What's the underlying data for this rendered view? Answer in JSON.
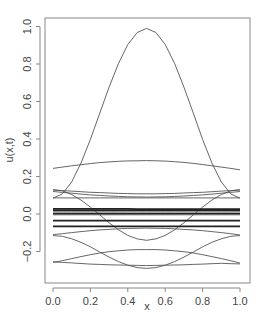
{
  "chart_data": {
    "type": "line",
    "title": "",
    "xlabel": "x",
    "ylabel": "u(x,t)",
    "xlim": [
      -0.04,
      1.04
    ],
    "ylim": [
      -0.37,
      1.04
    ],
    "grid": false,
    "legend": "none",
    "x_ticks": [
      0.0,
      0.2,
      0.4,
      0.6,
      0.8,
      1.0
    ],
    "x_tick_labels": [
      "0.0",
      "0.2",
      "0.4",
      "0.6",
      "0.8",
      "1.0"
    ],
    "y_ticks": [
      -0.2,
      0.0,
      0.2,
      0.4,
      0.6,
      0.8,
      1.0
    ],
    "y_tick_labels": [
      "−0.2",
      "0.0",
      "0.2",
      "0.4",
      "0.6",
      "0.8",
      "1.0"
    ],
    "x": [
      0,
      0.05,
      0.1,
      0.15,
      0.2,
      0.25,
      0.3,
      0.35,
      0.4,
      0.45,
      0.5,
      0.55,
      0.6,
      0.65,
      0.7,
      0.75,
      0.8,
      0.85,
      0.9,
      0.95,
      1.0
    ],
    "series": [
      {
        "name": "t0",
        "bold": false,
        "values": [
          0.085,
          0.107,
          0.171,
          0.272,
          0.398,
          0.538,
          0.677,
          0.803,
          0.904,
          0.968,
          0.99,
          0.968,
          0.904,
          0.803,
          0.677,
          0.538,
          0.398,
          0.272,
          0.171,
          0.107,
          0.085
        ]
      },
      {
        "name": "t1",
        "bold": false,
        "values": [
          0.13,
          0.123,
          0.104,
          0.074,
          0.037,
          -0.005,
          -0.047,
          -0.084,
          -0.114,
          -0.133,
          -0.14,
          -0.133,
          -0.114,
          -0.084,
          -0.047,
          -0.005,
          0.037,
          0.074,
          0.104,
          0.123,
          0.13
        ]
      },
      {
        "name": "t2",
        "bold": false,
        "values": [
          -0.115,
          -0.119,
          -0.132,
          -0.151,
          -0.175,
          -0.203,
          -0.23,
          -0.254,
          -0.273,
          -0.286,
          -0.29,
          -0.286,
          -0.273,
          -0.254,
          -0.23,
          -0.203,
          -0.175,
          -0.151,
          -0.132,
          -0.119,
          -0.115
        ]
      },
      {
        "name": "t3",
        "bold": false,
        "values": [
          0.243,
          0.25,
          0.257,
          0.263,
          0.269,
          0.274,
          0.278,
          0.281,
          0.283,
          0.284,
          0.285,
          0.284,
          0.282,
          0.279,
          0.275,
          0.27,
          0.264,
          0.257,
          0.25,
          0.243,
          0.236
        ]
      },
      {
        "name": "t4",
        "bold": false,
        "values": [
          -0.258,
          -0.249,
          -0.238,
          -0.227,
          -0.217,
          -0.208,
          -0.201,
          -0.196,
          -0.192,
          -0.19,
          -0.19,
          -0.19,
          -0.192,
          -0.196,
          -0.201,
          -0.208,
          -0.217,
          -0.227,
          -0.238,
          -0.249,
          -0.262
        ]
      },
      {
        "name": "t5",
        "bold": false,
        "values": [
          -0.11,
          -0.105,
          -0.099,
          -0.094,
          -0.089,
          -0.085,
          -0.082,
          -0.079,
          -0.077,
          -0.076,
          -0.075,
          -0.076,
          -0.077,
          -0.079,
          -0.082,
          -0.085,
          -0.089,
          -0.094,
          -0.099,
          -0.105,
          -0.112
        ]
      },
      {
        "name": "t6",
        "bold": false,
        "values": [
          -0.255,
          -0.258,
          -0.261,
          -0.264,
          -0.267,
          -0.269,
          -0.271,
          -0.272,
          -0.273,
          -0.274,
          -0.275,
          -0.274,
          -0.273,
          -0.272,
          -0.271,
          -0.269,
          -0.267,
          -0.265,
          -0.263,
          -0.265,
          -0.266
        ]
      },
      {
        "name": "t7",
        "bold": false,
        "values": [
          0.128,
          0.125,
          0.122,
          0.119,
          0.116,
          0.114,
          0.112,
          0.11,
          0.109,
          0.108,
          0.108,
          0.108,
          0.109,
          0.11,
          0.112,
          0.114,
          0.116,
          0.119,
          0.122,
          0.125,
          0.128
        ]
      },
      {
        "name": "t8",
        "bold": false,
        "values": [
          0.12,
          0.115,
          0.111,
          0.106,
          0.102,
          0.099,
          0.096,
          0.094,
          0.092,
          0.091,
          0.09,
          0.091,
          0.092,
          0.094,
          0.096,
          0.099,
          0.102,
          0.106,
          0.111,
          0.115,
          0.12
        ]
      },
      {
        "name": "t9",
        "bold": false,
        "values": [
          0.086,
          0.086,
          0.086,
          0.086,
          0.086,
          0.086,
          0.086,
          0.086,
          0.086,
          0.086,
          0.086,
          0.086,
          0.086,
          0.086,
          0.086,
          0.086,
          0.086,
          0.086,
          0.086,
          0.086,
          0.086
        ]
      },
      {
        "name": "t10",
        "bold": true,
        "values": [
          0.027,
          0.027,
          0.027,
          0.027,
          0.027,
          0.027,
          0.027,
          0.027,
          0.027,
          0.026,
          0.026,
          0.026,
          0.026,
          0.026,
          0.026,
          0.026,
          0.026,
          0.026,
          0.026,
          0.026,
          0.026
        ]
      },
      {
        "name": "t11",
        "bold": true,
        "values": [
          0.02,
          0.02,
          0.02,
          0.02,
          0.02,
          0.02,
          0.02,
          0.02,
          0.02,
          0.02,
          0.02,
          0.02,
          0.02,
          0.02,
          0.02,
          0.02,
          0.02,
          0.02,
          0.02,
          0.02,
          0.02
        ]
      },
      {
        "name": "t12",
        "bold": false,
        "values": [
          0.012,
          0.012,
          0.012,
          0.012,
          0.012,
          0.012,
          0.012,
          0.012,
          0.012,
          0.012,
          0.012,
          0.012,
          0.012,
          0.012,
          0.012,
          0.012,
          0.012,
          0.012,
          0.012,
          0.012,
          0.012
        ]
      },
      {
        "name": "t13",
        "bold": true,
        "values": [
          0.002,
          0.002,
          0.002,
          0.002,
          0.002,
          0.002,
          0.002,
          0.002,
          0.002,
          0.002,
          0.002,
          0.002,
          0.002,
          0.002,
          0.002,
          0.002,
          0.002,
          0.002,
          0.002,
          0.002,
          0.002
        ]
      },
      {
        "name": "t14",
        "bold": false,
        "values": [
          -0.004,
          -0.004,
          -0.004,
          -0.004,
          -0.004,
          -0.004,
          -0.004,
          -0.004,
          -0.004,
          -0.004,
          -0.004,
          -0.004,
          -0.004,
          -0.004,
          -0.004,
          -0.004,
          -0.004,
          -0.004,
          -0.004,
          -0.004,
          -0.004
        ]
      },
      {
        "name": "t15",
        "bold": true,
        "values": [
          -0.035,
          -0.035,
          -0.035,
          -0.035,
          -0.035,
          -0.035,
          -0.035,
          -0.035,
          -0.035,
          -0.035,
          -0.035,
          -0.035,
          -0.035,
          -0.035,
          -0.035,
          -0.035,
          -0.035,
          -0.035,
          -0.035,
          -0.035,
          -0.035
        ]
      },
      {
        "name": "t16",
        "bold": true,
        "values": [
          -0.066,
          -0.066,
          -0.066,
          -0.066,
          -0.066,
          -0.066,
          -0.066,
          -0.066,
          -0.066,
          -0.066,
          -0.066,
          -0.066,
          -0.066,
          -0.066,
          -0.066,
          -0.066,
          -0.066,
          -0.066,
          -0.066,
          -0.066,
          -0.066
        ]
      }
    ]
  }
}
